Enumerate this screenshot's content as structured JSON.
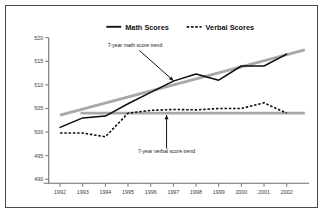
{
  "chart_data": {
    "type": "line",
    "title": "",
    "xlabel": "",
    "ylabel": "",
    "categories": [
      "1992",
      "1993",
      "1994",
      "1995",
      "1996",
      "1997",
      "1998",
      "1999",
      "2000",
      "2001",
      "2002"
    ],
    "x": [
      1992,
      1993,
      1994,
      1995,
      1996,
      1997,
      1998,
      1999,
      2000,
      2001,
      2002
    ],
    "xlim": [
      1991.5,
      2002.9
    ],
    "ylim": [
      490,
      520
    ],
    "ytick_labels": [
      "490",
      "495",
      "500",
      "505",
      "510",
      "515",
      "520"
    ],
    "yticks": [
      490,
      495,
      500,
      505,
      510,
      515,
      520
    ],
    "grid": false,
    "legend_position": "top-center",
    "series": [
      {
        "name": "Math Scores",
        "style": "solid",
        "color": "#0d0d0d",
        "values": [
          501,
          503,
          503.4,
          506,
          508.4,
          510.8,
          512.3,
          511,
          514,
          514,
          516.5
        ]
      },
      {
        "name": "Verbal Scores",
        "style": "dashed",
        "color": "#0d0d0d",
        "values": [
          499.8,
          499.8,
          499,
          504,
          504.6,
          504.8,
          504.7,
          505,
          505,
          506.2,
          504
        ]
      }
    ],
    "trend_lines": [
      {
        "name": "7-year math score trend",
        "color": "#a8a8a8",
        "x_start": 1992,
        "y_start": 503.6,
        "x_end": 2002.8,
        "y_end": 517.4
      },
      {
        "name": "7-year verbal score trend",
        "color": "#a8a8a8",
        "x_start": 1992.9,
        "y_start": 504,
        "x_end": 2002.8,
        "y_end": 504
      }
    ],
    "annotations": [
      {
        "text": "7-year math score trend",
        "label_x": 1994.1,
        "label_y": 518.1,
        "arrow_from_x": 1995.5,
        "arrow_from_y": 517.3,
        "arrow_to_x": 1997.0,
        "arrow_to_y": 510.9
      },
      {
        "text": "7-year verbal score trend",
        "label_x": 1996.7,
        "label_y": 495.6,
        "arrow_from_x": 1996.7,
        "arrow_from_y": 496.5,
        "arrow_to_x": 1996.7,
        "arrow_to_y": 503.6
      }
    ],
    "legend": [
      {
        "label": "Math Scores",
        "style": "solid"
      },
      {
        "label": "Verbal Scores",
        "style": "dashed"
      }
    ]
  }
}
